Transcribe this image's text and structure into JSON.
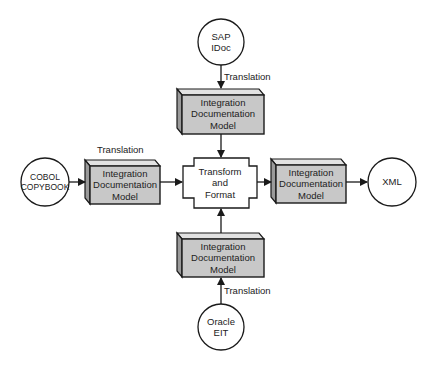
{
  "diagram": {
    "colors": {
      "box_fill": "#c8c8c8",
      "box_side": "#9a9a9a",
      "box_top": "#e2e2e2",
      "stroke": "#1a1a1a",
      "circle_fill": "#ffffff",
      "transform_fill": "#ffffff"
    },
    "sources": [
      {
        "id": "sap",
        "lines": [
          "SAP",
          "IDoc"
        ]
      },
      {
        "id": "cobol",
        "lines": [
          "COBOL",
          "COPYBOOK"
        ]
      },
      {
        "id": "oracle",
        "lines": [
          "Oracle",
          "EIT"
        ]
      }
    ],
    "target": {
      "id": "xml",
      "lines": [
        "XML"
      ]
    },
    "model_box": {
      "lines": [
        "Integration",
        "Documentation",
        "Model"
      ]
    },
    "transform": {
      "lines": [
        "Transform",
        "and",
        "Format"
      ]
    },
    "edge_labels": {
      "sap_translation": "Translation",
      "cobol_translation": "Translation",
      "oracle_translation": "Translation"
    }
  }
}
